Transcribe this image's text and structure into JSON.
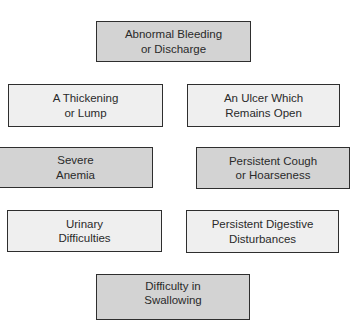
{
  "diagram": {
    "colors": {
      "background": "#ffffff",
      "dark_fill": "#d3d3d3",
      "light_fill": "#efefef",
      "border": "#2e2e2e",
      "text": "#2a2a2a"
    },
    "boxes": [
      {
        "id": "abnormal-bleeding",
        "style": "dark",
        "lines": [
          "Abnormal Bleeding",
          "or Discharge"
        ]
      },
      {
        "id": "thickening-lump",
        "style": "light",
        "lines": [
          "A Thickening",
          "or Lump"
        ]
      },
      {
        "id": "ulcer-open",
        "style": "light",
        "lines": [
          "An Ulcer Which",
          "Remains Open"
        ]
      },
      {
        "id": "severe-anemia",
        "style": "dark",
        "lines": [
          "Severe",
          "Anemia"
        ]
      },
      {
        "id": "persistent-cough",
        "style": "dark",
        "lines": [
          "Persistent Cough",
          "or Hoarseness"
        ]
      },
      {
        "id": "urinary",
        "style": "light",
        "lines": [
          "Urinary",
          "Difficulties"
        ]
      },
      {
        "id": "digestive",
        "style": "light",
        "lines": [
          "Persistent Digestive",
          "Disturbances"
        ]
      },
      {
        "id": "swallowing",
        "style": "dark",
        "lines": [
          "Difficulty in",
          "Swallowing"
        ]
      }
    ]
  }
}
